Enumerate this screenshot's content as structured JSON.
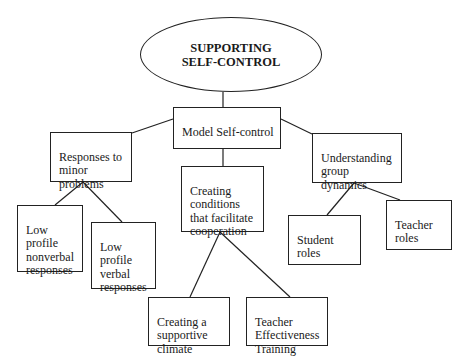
{
  "diagram": {
    "root": {
      "label": "SUPPORTING\nSELF-CONTROL"
    },
    "nodes": {
      "model": {
        "label": "Model Self-control"
      },
      "responses": {
        "label": "Responses to\nminor\nproblems"
      },
      "conditions": {
        "label": "Creating\nconditions\nthat facilitate\ncooperation"
      },
      "group": {
        "label": "Understanding\ngroup\ndynamics"
      },
      "nonverbal": {
        "label": "Low\nprofile\nnonverbal\nresponses"
      },
      "verbal": {
        "label": "Low\nprofile\nverbal\nresponses"
      },
      "student": {
        "label": "Student\nroles"
      },
      "teacher_roles": {
        "label": "Teacher\nroles"
      },
      "climate": {
        "label": "Creating a\nsupportive\nclimate"
      },
      "tet": {
        "label": "Teacher\nEffectiveness\nTraining"
      }
    },
    "edges": [
      [
        "root",
        "model"
      ],
      [
        "model",
        "responses"
      ],
      [
        "model",
        "conditions"
      ],
      [
        "model",
        "group"
      ],
      [
        "responses",
        "nonverbal"
      ],
      [
        "responses",
        "verbal"
      ],
      [
        "conditions",
        "climate"
      ],
      [
        "conditions",
        "tet"
      ],
      [
        "group",
        "student"
      ],
      [
        "group",
        "teacher_roles"
      ]
    ]
  }
}
